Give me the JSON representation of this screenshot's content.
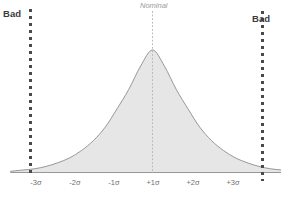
{
  "chart_data": {
    "type": "area",
    "title": "",
    "subtitle": "",
    "xlabel": "",
    "ylabel": "",
    "grid": false,
    "legend_position": "none",
    "distribution": "normal",
    "x": [
      -3.6,
      -3.3,
      -3.0,
      -2.7,
      -2.4,
      -2.1,
      -1.8,
      -1.5,
      -1.2,
      -0.9,
      -0.6,
      -0.3,
      0.0,
      0.3,
      0.6,
      0.9,
      1.2,
      1.5,
      1.8,
      2.1,
      2.4,
      2.7,
      3.0,
      3.3,
      3.6
    ],
    "values": [
      0.01,
      0.02,
      0.03,
      0.05,
      0.08,
      0.12,
      0.18,
      0.26,
      0.37,
      0.52,
      0.68,
      0.87,
      1.0,
      0.87,
      0.68,
      0.52,
      0.37,
      0.26,
      0.18,
      0.12,
      0.08,
      0.05,
      0.03,
      0.02,
      0.01
    ],
    "xlim": [
      -3.8,
      3.8
    ],
    "ylim": [
      0,
      1.05
    ],
    "peak_x": 0,
    "peak_value": 1.0,
    "fill_color": "#e6e6e6",
    "line_color": "#8c8c8c",
    "tick_positions": [
      -3,
      -2,
      -1,
      1,
      2,
      3
    ],
    "tick_labels": [
      "-3σ",
      "-2σ",
      "-1σ",
      "+1σ",
      "+2σ",
      "+3σ"
    ],
    "annotations": [
      {
        "name": "nominal",
        "label": "Nominal",
        "x": 0,
        "color": "#9a9a9a",
        "style": "dotted-vertical-line"
      },
      {
        "name": "bad-left",
        "label": "Bad",
        "x": -3.45,
        "color": "#3b3b3b",
        "style": "dotted-vertical-line"
      },
      {
        "name": "bad-right",
        "label": "Bad",
        "x": 3.45,
        "color": "#3b3b3b",
        "style": "dotted-vertical-line"
      }
    ]
  },
  "labels": {
    "bad_left": "Bad",
    "bad_right": "Bad",
    "nominal": "Nominal"
  },
  "axis": {
    "ticks": [
      {
        "label": "-3σ",
        "x_px": 36
      },
      {
        "label": "-2σ",
        "x_px": 75
      },
      {
        "label": "-1σ",
        "x_px": 114
      },
      {
        "label": "+1σ",
        "x_px": 153
      },
      {
        "label": "+2σ",
        "x_px": 193
      },
      {
        "label": "+3σ",
        "x_px": 233
      }
    ]
  },
  "colors": {
    "curve_fill": "#e6e6e6",
    "curve_stroke": "#8c8c8c",
    "limit_line": "#4a4a4a",
    "nominal_line": "#b9b9b9",
    "bad_text": "#3b3b3b",
    "nominal_text": "#9a9a9a",
    "tick_text": "#6f6f6f",
    "background": "#ffffff"
  }
}
